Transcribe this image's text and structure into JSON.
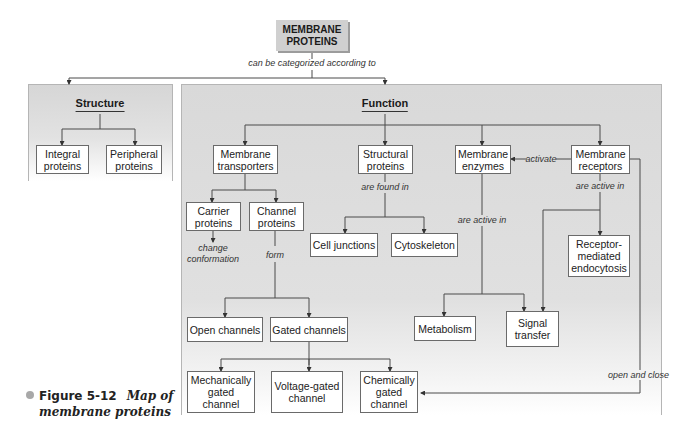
{
  "root": {
    "label": "MEMBRANE\nPROTEINS",
    "link_label": "can be categorized according to"
  },
  "structure": {
    "title": "Structure",
    "nodes": [
      {
        "id": "integral",
        "label": "Integral\nproteins"
      },
      {
        "id": "peripheral",
        "label": "Peripheral\nproteins"
      }
    ]
  },
  "function": {
    "title": "Function",
    "nodes": {
      "membrane_transporters": "Membrane\ntransporters",
      "structural_proteins": "Structural\nproteins",
      "membrane_enzymes": "Membrane\nenzymes",
      "membrane_receptors": "Membrane\nreceptors",
      "carrier_proteins": "Carrier\nproteins",
      "channel_proteins": "Channel\nproteins",
      "cell_junctions": "Cell junctions",
      "cytoskeleton": "Cytoskeleton",
      "receptor_mediated_endocytosis": "Receptor-\nmediated\nendocytosis",
      "open_channels": "Open channels",
      "gated_channels": "Gated channels",
      "metabolism": "Metabolism",
      "signal_transfer": "Signal\ntransfer",
      "mechanically_gated": "Mechanically\ngated\nchannel",
      "voltage_gated": "Voltage-gated\nchannel",
      "chemically_gated": "Chemically\ngated\nchannel"
    },
    "links": {
      "are_found_in": "are found in",
      "activate": "activate",
      "enzymes_are_active_in": "are active in",
      "receptors_are_active_in": "are active in",
      "change_conformation": "change\nconformation",
      "form": "form",
      "open_and_close": "open and close"
    }
  },
  "caption": {
    "figure_number": "Figure 5-12",
    "title_line1": "Map of",
    "title_line2": "membrane proteins"
  },
  "colors": {
    "panel_gray": "#d9d9d9",
    "root_box": "#d0d0d0",
    "line": "#4a4a4a",
    "bullet": "#a8a8a8"
  }
}
